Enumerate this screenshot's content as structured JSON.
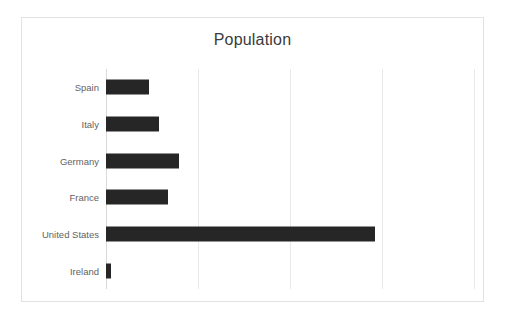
{
  "chart_data": {
    "type": "bar",
    "orientation": "horizontal",
    "title": "Population",
    "xlabel": "",
    "ylabel": "",
    "categories": [
      "Spain",
      "Italy",
      "Germany",
      "France",
      "United States",
      "Ireland"
    ],
    "values": [
      47,
      58,
      79,
      67,
      292,
      5
    ],
    "xlim": [
      0,
      400
    ],
    "gridlines": [
      0,
      100,
      200,
      300,
      400
    ],
    "tick_labels": [],
    "grid": true,
    "legend": false,
    "legend_position": "none",
    "series": [
      {
        "name": "Population",
        "values": [
          47,
          58,
          79,
          67,
          292,
          5
        ]
      }
    ],
    "bar_color": "#262626",
    "gridline_color": "#e8e8e8",
    "axis_color": "#d9d9d9",
    "frame_color": "#e2e2e2",
    "background": "#ffffff",
    "title_color": "#3b3b3b",
    "label_color": "#636363"
  }
}
